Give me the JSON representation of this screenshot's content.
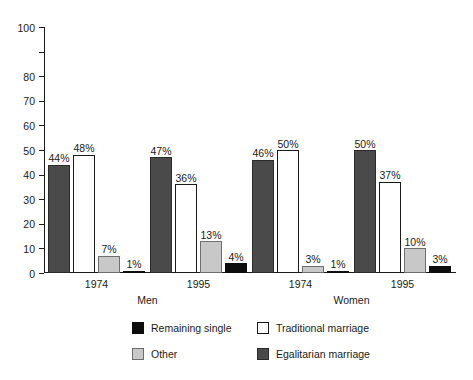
{
  "chart_data": {
    "type": "bar",
    "title": "",
    "subtitle": "",
    "xlabel": "",
    "ylabel": "",
    "ylim": [
      0,
      100
    ],
    "yticks": [
      0,
      10,
      20,
      30,
      40,
      50,
      60,
      70,
      80,
      100
    ],
    "ytick_labels": [
      "0",
      "10",
      "20",
      "30",
      "40",
      "50",
      "60",
      "70",
      "80",
      "100"
    ],
    "grid": false,
    "legend_position": "bottom",
    "categories": [
      "1974",
      "1995",
      "1974",
      "1995"
    ],
    "supergroups": [
      {
        "label": "Men",
        "categories": [
          "1974",
          "1995"
        ]
      },
      {
        "label": "Women",
        "categories": [
          "1974",
          "1995"
        ]
      }
    ],
    "series": [
      {
        "name": "Egalitarian marriage",
        "color": "#4a4a4a",
        "values": [
          44,
          47,
          46,
          50
        ],
        "labels": [
          "44%",
          "47%",
          "46%",
          "50%"
        ]
      },
      {
        "name": "Traditional marriage",
        "color": "#ffffff",
        "values": [
          48,
          36,
          50,
          37
        ],
        "labels": [
          "48%",
          "36%",
          "50%",
          "37%"
        ]
      },
      {
        "name": "Other",
        "color": "#c8c8c8",
        "values": [
          7,
          13,
          3,
          10
        ],
        "labels": [
          "7%",
          "13%",
          "3%",
          "10%"
        ]
      },
      {
        "name": "Remaining single",
        "color": "#0d0d0d",
        "values": [
          1,
          4,
          1,
          3
        ],
        "labels": [
          "1%",
          "4%",
          "1%",
          "3%"
        ]
      }
    ],
    "legend_entries": [
      {
        "name": "Remaining single",
        "swatch": "single"
      },
      {
        "name": "Traditional marriage",
        "swatch": "traditional"
      },
      {
        "name": "Other",
        "swatch": "other"
      },
      {
        "name": "Egalitarian marriage",
        "swatch": "egalitarian"
      }
    ]
  },
  "axis": {
    "y_labels": [
      "100",
      "80",
      "70",
      "60",
      "50",
      "40",
      "30",
      "20",
      "10",
      "0"
    ]
  },
  "groups": [
    {
      "year": "1974",
      "super": "Men"
    },
    {
      "year": "1995",
      "super": "Men"
    },
    {
      "year": "1974",
      "super": "Women"
    },
    {
      "year": "1995",
      "super": "Women"
    }
  ],
  "bars": {
    "g0": {
      "egalitarian": "44%",
      "traditional": "48%",
      "other": "7%",
      "single": "1%"
    },
    "g1": {
      "egalitarian": "47%",
      "traditional": "36%",
      "other": "13%",
      "single": "4%"
    },
    "g2": {
      "egalitarian": "46%",
      "traditional": "50%",
      "other": "3%",
      "single": "1%"
    },
    "g3": {
      "egalitarian": "50%",
      "traditional": "37%",
      "other": "10%",
      "single": "3%"
    }
  },
  "legend": {
    "single": "Remaining single",
    "traditional": "Traditional marriage",
    "other": "Other",
    "egalitarian": "Egalitarian marriage"
  },
  "xlabels": {
    "g0": "1974",
    "g1": "1995",
    "g2": "1974",
    "g3": "1995",
    "men": "Men",
    "women": "Women"
  }
}
